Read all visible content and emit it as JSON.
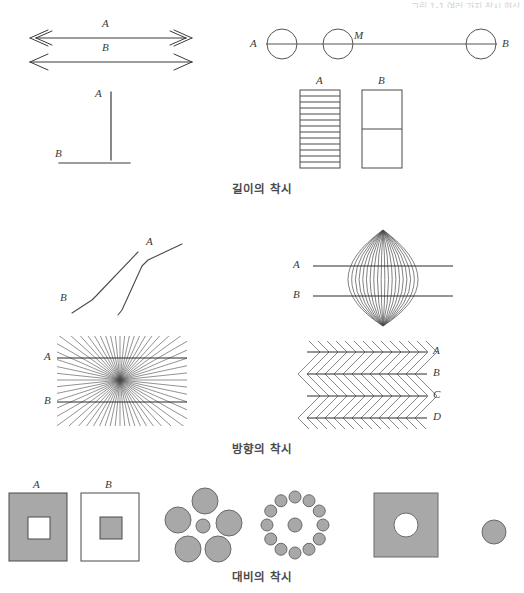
{
  "page": {
    "background_color": "#ffffff",
    "ink_color": "#3a3a3a",
    "gray_fill": "#a8a8a8",
    "width": 524,
    "height": 593,
    "bleed_text": "그림 1-1 여러 가지 착시 현상"
  },
  "sections": [
    {
      "id": "length",
      "caption": "길이의 착시",
      "figures": [
        {
          "id": "muller-lyer",
          "name": "muller-lyer-illusion",
          "labels": [
            "A",
            "B"
          ],
          "description": "Two equal horizontal lines; A has inward arrowheads, B has outward arrowheads"
        },
        {
          "id": "circles-line",
          "name": "circles-on-line-illusion",
          "labels": [
            "A",
            "M",
            "B"
          ],
          "circle_count": 3,
          "description": "Three circles on one horizontal line; M marks the midpoint circle"
        },
        {
          "id": "vertical-horizontal",
          "name": "vertical-horizontal-illusion",
          "labels": [
            "A",
            "B"
          ],
          "description": "Vertical line A appears longer than equal horizontal line B"
        },
        {
          "id": "striped-bars",
          "name": "striped-rectangles-illusion",
          "labels": [
            "A",
            "B"
          ],
          "stripe_count_a": 13,
          "stripe_count_b": 1,
          "description": "Rectangle A filled with many horizontal stripes, B divided once"
        }
      ]
    },
    {
      "id": "direction",
      "caption": "방향의 착시",
      "figures": [
        {
          "id": "poggendorff",
          "name": "poggendorff-zigzag-illusion",
          "labels": [
            "A",
            "B"
          ],
          "description": "Two parallel zigzag lines appear misaligned"
        },
        {
          "id": "lens-diamond",
          "name": "lens-convergence-illusion",
          "labels": [
            "A",
            "B"
          ],
          "ray_count": 19,
          "description": "Diamond of converging rays bows two straight horizontal lines"
        },
        {
          "id": "hering",
          "name": "hering-radiating-illusion",
          "labels": [
            "A",
            "B"
          ],
          "ray_count": 60,
          "description": "Radiating lines from a center make two parallel lines appear bowed"
        },
        {
          "id": "zollner",
          "name": "zollner-illusion",
          "labels": [
            "A",
            "B",
            "C",
            "D"
          ],
          "line_count": 4,
          "description": "Four parallel lines with alternating hatch marks appear tilted"
        }
      ]
    },
    {
      "id": "contrast",
      "caption": "대비의 착시",
      "figures": [
        {
          "id": "nested-squares",
          "name": "nested-squares-contrast-illusion",
          "labels": [
            "A",
            "B"
          ],
          "description": "Square A gray with white inner square, square B white with gray inner square"
        },
        {
          "id": "ebbinghaus-large",
          "name": "ebbinghaus-large-surround",
          "surround_count": 5,
          "description": "Small center circle surrounded by five large circles"
        },
        {
          "id": "ebbinghaus-small",
          "name": "ebbinghaus-small-surround",
          "surround_count": 12,
          "description": "Center circle surrounded by twelve small circles"
        },
        {
          "id": "hole-square",
          "name": "square-with-hole",
          "description": "Gray square with a white circular hole"
        },
        {
          "id": "lone-circle",
          "name": "lone-gray-circle",
          "description": "Solitary gray circle of the same diameter as the hole"
        }
      ]
    }
  ]
}
